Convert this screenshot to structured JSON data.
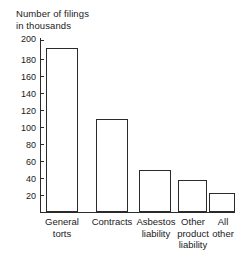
{
  "chart_data": {
    "type": "bar",
    "title": "Number of filings in thousands",
    "title_lines": [
      "Number of filings",
      "in thousands"
    ],
    "xlabel": "",
    "ylabel": "Number of filings in thousands",
    "categories": [
      "General torts",
      "Contracts",
      "Asbestos liability",
      "Other product liability",
      "All other"
    ],
    "category_lines": [
      [
        "General",
        "torts"
      ],
      [
        "Contracts"
      ],
      [
        "Asbestos",
        "liability"
      ],
      [
        "Other",
        "product",
        "liability"
      ],
      [
        "All",
        "other"
      ]
    ],
    "values": [
      191,
      108,
      49,
      37,
      22
    ],
    "ylim": [
      0,
      200
    ],
    "ytick_values": [
      20,
      40,
      60,
      80,
      100,
      120,
      140,
      160,
      180,
      200
    ],
    "ytick_labels": [
      "20",
      "40",
      "60",
      "80",
      "100",
      "120",
      "140",
      "160",
      "180",
      "200"
    ],
    "grid": false,
    "legend": false,
    "bar_fill_color": "#ffffff",
    "bar_edge_color": "#2b2b2b",
    "axis_color": "#2b2b2b",
    "background_color": "#ffffff",
    "text_color": "#1a1a1a"
  }
}
